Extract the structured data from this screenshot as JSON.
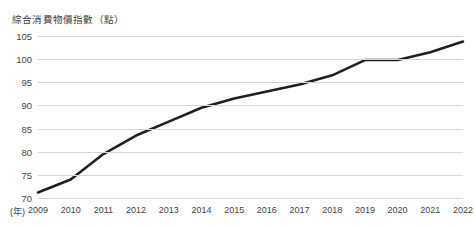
{
  "chart_data": {
    "type": "line",
    "title": "綜合消費物價指數（點）",
    "xlabel": "(年)",
    "ylabel": "綜合消費物價指數（點）",
    "categories": [
      "2009",
      "2010",
      "2011",
      "2012",
      "2013",
      "2014",
      "2015",
      "2016",
      "2017",
      "2018",
      "2019",
      "2020",
      "2021",
      "2022"
    ],
    "x": [
      2009,
      2010,
      2011,
      2012,
      2013,
      2014,
      2015,
      2016,
      2017,
      2018,
      2019,
      2020,
      2021,
      2022
    ],
    "values": [
      71.2,
      74.0,
      79.5,
      83.5,
      86.5,
      89.5,
      91.5,
      93.0,
      94.5,
      96.5,
      99.8,
      99.8,
      101.5,
      103.8
    ],
    "series": [
      {
        "name": "綜合消費物價指數",
        "values": [
          71.2,
          74.0,
          79.5,
          83.5,
          86.5,
          89.5,
          91.5,
          93.0,
          94.5,
          96.5,
          99.8,
          99.8,
          101.5,
          103.8
        ]
      }
    ],
    "ylim": [
      70,
      105
    ],
    "yticks": [
      70,
      75,
      80,
      85,
      90,
      95,
      100,
      105
    ],
    "ytick_labels": [
      "70",
      "75",
      "80",
      "85",
      "90",
      "95",
      "100",
      "105"
    ],
    "xlim": [
      2009,
      2022
    ],
    "grid": "horizontal",
    "legend": "none",
    "line_color": "#231f20",
    "grid_color": "#d6d6d6",
    "text_color": "#3c3c3c",
    "background": "#ffffff"
  }
}
